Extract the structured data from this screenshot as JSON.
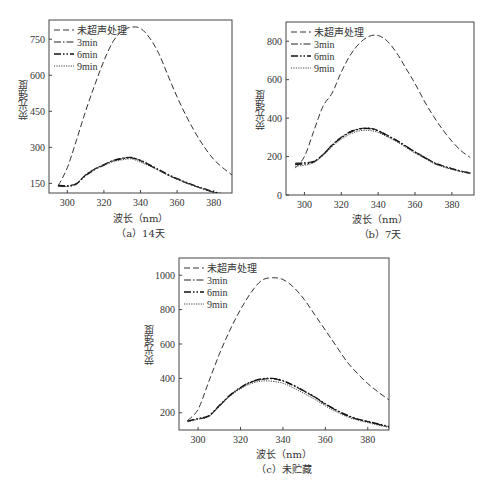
{
  "figure": {
    "series_styles": [
      {
        "name": "未超声处理",
        "dash": "6,3",
        "width": 1.0,
        "color": "#333333"
      },
      {
        "name": "3min",
        "dash": "7,2,1.5,2",
        "width": 1.2,
        "color": "#222222"
      },
      {
        "name": "6min",
        "dash": "7,2,1.5,2,1.5,2",
        "width": 1.4,
        "color": "#111111"
      },
      {
        "name": "9min",
        "dash": "1.2,1.2",
        "width": 1.0,
        "color": "#444444"
      }
    ],
    "bottom_caption_faded": ""
  },
  "chart_data": [
    {
      "id": "a",
      "type": "line",
      "caption": "（a）14天",
      "title": "",
      "xlabel": "波长（nm）",
      "ylabel": "荧光强度",
      "xlim": [
        290,
        390
      ],
      "ylim": [
        110,
        830
      ],
      "xticks": [
        300,
        320,
        340,
        360,
        380
      ],
      "yticks": [
        150,
        300,
        450,
        600,
        750
      ],
      "grid": false,
      "legend_position": "upper left",
      "box": {
        "left": 49,
        "top": 20,
        "right": 232,
        "bottom": 193
      },
      "x": [
        295,
        300,
        305,
        310,
        315,
        320,
        325,
        330,
        335,
        340,
        345,
        350,
        355,
        360,
        365,
        370,
        375,
        380,
        385,
        390
      ],
      "series": [
        {
          "name": "未超声处理",
          "values": [
            140,
            215,
            330,
            450,
            560,
            660,
            740,
            785,
            800,
            795,
            755,
            690,
            600,
            510,
            430,
            360,
            300,
            250,
            215,
            185
          ]
        },
        {
          "name": "3min",
          "values": [
            142,
            140,
            150,
            185,
            210,
            228,
            245,
            255,
            258,
            245,
            225,
            205,
            185,
            168,
            152,
            138,
            125,
            113,
            105,
            100
          ]
        },
        {
          "name": "6min",
          "values": [
            140,
            138,
            148,
            183,
            208,
            226,
            244,
            253,
            256,
            246,
            227,
            207,
            187,
            170,
            154,
            140,
            127,
            115,
            106,
            101
          ]
        },
        {
          "name": "9min",
          "values": [
            138,
            137,
            150,
            186,
            210,
            226,
            240,
            248,
            252,
            238,
            222,
            204,
            185,
            168,
            152,
            138,
            125,
            114,
            105,
            100
          ]
        }
      ]
    },
    {
      "id": "b",
      "type": "line",
      "caption": "（b）7天",
      "title": "",
      "xlabel": "波长（nm）",
      "ylabel": "荧光强度",
      "xlim": [
        290,
        392
      ],
      "ylim": [
        0,
        900
      ],
      "xticks": [
        300,
        320,
        340,
        360,
        380
      ],
      "yticks": [
        0,
        200,
        400,
        600,
        800
      ],
      "grid": false,
      "legend_position": "upper left",
      "box": {
        "left": 286,
        "top": 22,
        "right": 474,
        "bottom": 195
      },
      "x": [
        295,
        300,
        305,
        310,
        315,
        320,
        325,
        330,
        335,
        340,
        345,
        350,
        355,
        360,
        365,
        370,
        375,
        380,
        385,
        390
      ],
      "series": [
        {
          "name": "未超声处理",
          "values": [
            140,
            200,
            330,
            460,
            530,
            640,
            730,
            790,
            825,
            830,
            800,
            740,
            660,
            580,
            490,
            410,
            340,
            280,
            230,
            195
          ]
        },
        {
          "name": "3min",
          "values": [
            165,
            168,
            175,
            210,
            260,
            300,
            330,
            345,
            348,
            335,
            310,
            285,
            255,
            225,
            198,
            170,
            152,
            138,
            125,
            115
          ]
        },
        {
          "name": "6min",
          "values": [
            160,
            162,
            172,
            208,
            258,
            298,
            328,
            343,
            346,
            333,
            308,
            283,
            253,
            223,
            196,
            168,
            150,
            136,
            123,
            113
          ]
        },
        {
          "name": "9min",
          "values": [
            150,
            155,
            168,
            205,
            252,
            290,
            318,
            334,
            336,
            325,
            302,
            278,
            248,
            218,
            192,
            165,
            147,
            133,
            121,
            112
          ]
        }
      ]
    },
    {
      "id": "c",
      "type": "line",
      "caption": "（c）未贮藏",
      "title": "",
      "xlabel": "波长（nm）",
      "ylabel": "荧光强度",
      "xlim": [
        291,
        390
      ],
      "ylim": [
        100,
        1100
      ],
      "xticks": [
        300,
        320,
        340,
        360,
        380
      ],
      "yticks": [
        200,
        400,
        600,
        800,
        1000
      ],
      "grid": false,
      "legend_position": "upper left",
      "box": {
        "left": 179,
        "top": 258,
        "right": 389,
        "bottom": 430
      },
      "x": [
        295,
        300,
        305,
        310,
        315,
        320,
        325,
        330,
        335,
        340,
        345,
        350,
        355,
        360,
        365,
        370,
        375,
        380,
        385,
        390
      ],
      "series": [
        {
          "name": "未超声处理",
          "values": [
            155,
            220,
            380,
            540,
            680,
            800,
            900,
            970,
            985,
            975,
            930,
            860,
            770,
            680,
            590,
            500,
            430,
            370,
            320,
            275
          ]
        },
        {
          "name": "3min",
          "values": [
            150,
            165,
            180,
            240,
            300,
            345,
            378,
            395,
            398,
            385,
            358,
            325,
            290,
            250,
            215,
            185,
            163,
            148,
            133,
            118
          ]
        },
        {
          "name": "6min",
          "values": [
            152,
            167,
            182,
            242,
            302,
            347,
            380,
            397,
            400,
            387,
            360,
            327,
            292,
            252,
            217,
            187,
            165,
            150,
            135,
            120
          ]
        },
        {
          "name": "9min",
          "values": [
            148,
            162,
            178,
            238,
            296,
            340,
            370,
            385,
            383,
            372,
            345,
            312,
            278,
            240,
            207,
            178,
            158,
            143,
            128,
            115
          ]
        }
      ]
    }
  ]
}
